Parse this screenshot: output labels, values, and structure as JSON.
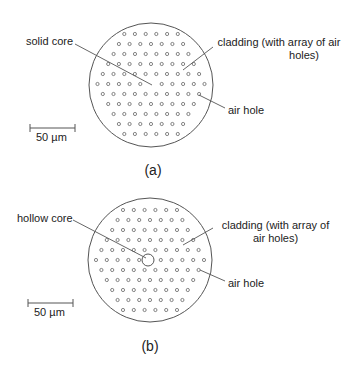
{
  "panels": [
    {
      "id": "a",
      "caption": "(a)",
      "fiber": {
        "cx": 151,
        "cy": 85,
        "r": 62
      },
      "lattice": {
        "rows": 11,
        "top_y": 34,
        "row_spacing": 10,
        "col_spacing": 10.7,
        "top_row_count": 6,
        "center_row_count": 11
      },
      "core": {
        "type": "solid",
        "hollow_r": 0
      },
      "labels": {
        "core": "solid core",
        "cladding_line1": "cladding (with array of air",
        "cladding_line2": "holes)",
        "air_hole": "air hole"
      },
      "pointers": {
        "core": [
          75,
          44,
          152,
          85
        ],
        "cladding": [
          213,
          47,
          183,
          70
        ],
        "air_hole": [
          199,
          95,
          225,
          108
        ]
      },
      "scale_bar": {
        "x1": 30,
        "x2": 75,
        "y": 128,
        "label": "50 µm"
      }
    },
    {
      "id": "b",
      "caption": "(b)",
      "fiber": {
        "cx": 150,
        "cy": 260,
        "r": 62
      },
      "lattice": {
        "rows": 11,
        "top_y": 210,
        "row_spacing": 10,
        "col_spacing": 10.8,
        "top_row_count": 6,
        "center_row_count": 11
      },
      "core": {
        "type": "hollow",
        "hollow_r": 6
      },
      "labels": {
        "core": "hollow core",
        "cladding_line1": "cladding (with array of",
        "cladding_line2": "air holes)",
        "air_hole": "air hole"
      },
      "pointers": {
        "core": [
          73,
          220,
          146,
          258
        ],
        "cladding": [
          213,
          228,
          183,
          245
        ],
        "air_hole": [
          200,
          270,
          225,
          281
        ]
      },
      "scale_bar": {
        "x1": 28,
        "x2": 73,
        "y": 303,
        "label": "50 µm"
      }
    }
  ],
  "colors": {
    "line": "#555555",
    "hole": "#666666",
    "text": "#222222"
  }
}
